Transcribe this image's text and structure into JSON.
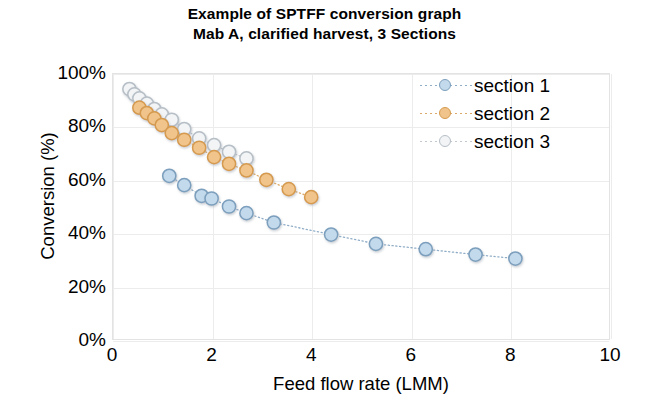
{
  "chart_data": {
    "type": "scatter",
    "title": "Example of SPTFF conversion graph",
    "subtitle": "Mab A, clarified harvest, 3 Sections",
    "xlabel": "Feed flow rate (LMM)",
    "ylabel": "Conversion (%)",
    "xlim": [
      0,
      10
    ],
    "ylim": [
      0,
      100
    ],
    "xticks": [
      "0",
      "2",
      "4",
      "6",
      "8",
      "10"
    ],
    "xtick_values": [
      0,
      2,
      4,
      6,
      8,
      10
    ],
    "yticks": [
      "0%",
      "20%",
      "40%",
      "60%",
      "80%",
      "100%"
    ],
    "ytick_values": [
      0,
      20,
      40,
      60,
      80,
      100
    ],
    "grid": true,
    "legend_position": "top-right",
    "marker": "circle",
    "line_style": "dotted",
    "series": [
      {
        "name": "section 1",
        "color": "#c3d9ec",
        "edge_color": "#7c9fbd",
        "x": [
          1.15,
          1.45,
          1.8,
          2.0,
          2.35,
          2.7,
          3.25,
          4.4,
          5.3,
          6.3,
          7.3,
          8.1
        ],
        "y": [
          61.5,
          58.0,
          54.0,
          53.0,
          50.0,
          47.5,
          44.0,
          39.5,
          36.0,
          34.0,
          32.0,
          30.5
        ]
      },
      {
        "name": "section 2",
        "color": "#f0c48a",
        "edge_color": "#d59a4e",
        "x": [
          0.55,
          0.7,
          0.85,
          1.0,
          1.2,
          1.45,
          1.75,
          2.05,
          2.35,
          2.7,
          3.1,
          3.55,
          4.0
        ],
        "y": [
          87.0,
          85.0,
          83.0,
          80.5,
          77.5,
          75.0,
          72.0,
          68.5,
          66.0,
          63.5,
          60.0,
          56.5,
          53.5
        ]
      },
      {
        "name": "section 3",
        "color": "#f2f4f6",
        "edge_color": "#b6bec6",
        "x": [
          0.35,
          0.45,
          0.55,
          0.7,
          0.85,
          1.0,
          1.2,
          1.45,
          1.75,
          2.05,
          2.35,
          2.7
        ],
        "y": [
          94.0,
          92.0,
          90.5,
          88.5,
          86.5,
          84.5,
          82.5,
          79.0,
          75.5,
          73.0,
          70.5,
          68.0
        ]
      }
    ]
  },
  "legend": {
    "items": [
      {
        "label": "section 1",
        "color": "#c3d9ec",
        "edge_color": "#7c9fbd"
      },
      {
        "label": "section 2",
        "color": "#f0c48a",
        "edge_color": "#d59a4e"
      },
      {
        "label": "section 3",
        "color": "#f2f4f6",
        "edge_color": "#b6bec6"
      }
    ]
  },
  "colors": {
    "grid": "#ececec",
    "frame": "#e3e3e3",
    "text": "#000000",
    "background": "#ffffff"
  }
}
